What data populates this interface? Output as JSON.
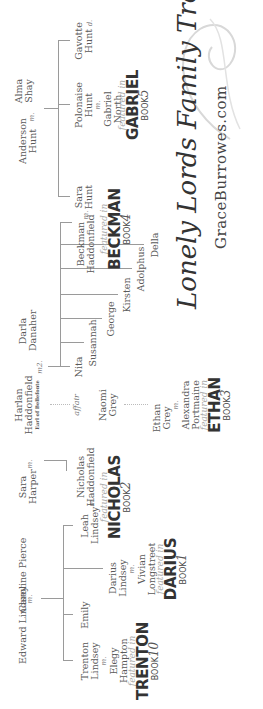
{
  "title": {
    "main": "Lonely Lords Family Tree",
    "site": "GraceBurrowes.com"
  },
  "marks": {
    "married": "m.",
    "married2": "m2.",
    "affair": "affair"
  },
  "families": {
    "lindsey": {
      "parent1": "Edward Lindsey",
      "parent2": "Caroline Pierce",
      "children": [
        {
          "name": "Trenton Lindsey",
          "spouse": "Elegy Hampton",
          "featured": {
            "prefix": "featured in",
            "book": "TRENTON",
            "label": "BOOK",
            "num": "10"
          }
        },
        {
          "name": "Emily"
        },
        {
          "name": "Darius Lindsey",
          "spouse": "Vivian Longstreet",
          "featured": {
            "prefix": "featured in",
            "book": "DARIUS",
            "label": "BOOK",
            "num": "1"
          }
        },
        {
          "name": "Leah Lindsey",
          "spouse": "Nicholas Haddonfield",
          "featured": {
            "prefix": "featured in",
            "book": "NICHOLAS",
            "label": "BOOK",
            "num": "2"
          }
        }
      ]
    },
    "haddonfield": {
      "parent1": "Harlan Haddonfield",
      "parent1_title": "Earl of Bellefonte",
      "first_wife": "Sara Harper",
      "second_wife": "Darla Danaher",
      "affair_with": "Naomi Grey",
      "first_children": [
        {
          "name": "Nicholas Haddonfield"
        }
      ],
      "second_children": [
        {
          "name": "Nita"
        },
        {
          "name": "Susannah"
        },
        {
          "name": "George"
        },
        {
          "name": "Kirsten"
        },
        {
          "name": "Adolphus"
        },
        {
          "name": "Della"
        },
        {
          "name": "Beckman Haddonfield",
          "spouse": "Sara Hunt",
          "featured": {
            "prefix": "featured in",
            "book": "BECKMAN",
            "label": "BOOK",
            "num": "4"
          }
        }
      ],
      "affair_child": {
        "name": "Ethan Grey",
        "spouse": "Alexandra Portmaine",
        "featured": {
          "prefix": "featured in",
          "book": "ETHAN",
          "label": "BOOK",
          "num": "3"
        }
      }
    },
    "hunt": {
      "parent1": "Anderson Hunt",
      "parent2": "Alma Shay",
      "children": [
        {
          "name": "Sara Hunt"
        },
        {
          "name": "Polonaise Hunt",
          "spouse": "Gabriel North",
          "featured": {
            "prefix": "featured in",
            "book": "GABRIEL",
            "label": "BOOK",
            "num": "5"
          }
        },
        {
          "name": "Gavotte Hunt",
          "suffix": "d."
        }
      ]
    }
  }
}
